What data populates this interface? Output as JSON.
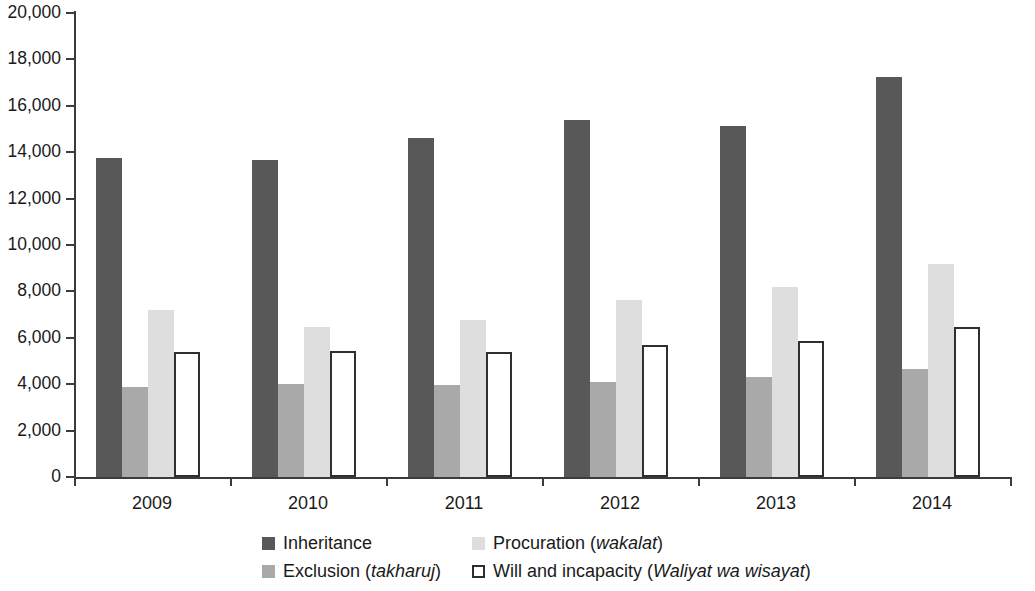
{
  "chart_data": {
    "type": "bar",
    "title": "",
    "subtitle": "",
    "xlabel": "",
    "ylabel": "",
    "categories": [
      "2009",
      "2010",
      "2011",
      "2012",
      "2013",
      "2014"
    ],
    "ylim": [
      0,
      20000
    ],
    "ytick_values": [
      0,
      2000,
      4000,
      6000,
      8000,
      10000,
      12000,
      14000,
      16000,
      18000,
      20000
    ],
    "ytick_labels": [
      "0",
      "2,000",
      "4,000",
      "6,000",
      "8,000",
      "10,000",
      "12,000",
      "14,000",
      "16,000",
      "18,000",
      "20,000"
    ],
    "grid": false,
    "legend_position": "bottom",
    "series": [
      {
        "name": "Inheritance",
        "label_plain": "Inheritance",
        "label_italic": "",
        "color": "#585858",
        "values": [
          13750,
          13650,
          14600,
          15400,
          15150,
          17250
        ]
      },
      {
        "name": "Exclusion (takharuj)",
        "label_plain": "Exclusion (",
        "label_italic": "takharuj",
        "label_tail": ")",
        "color": "#a9a9a9",
        "values": [
          3900,
          4000,
          3950,
          4100,
          4300,
          4650
        ]
      },
      {
        "name": "Procuration (wakalat)",
        "label_plain": "Procuration (",
        "label_italic": "wakalat",
        "label_tail": ")",
        "color": "#dedede",
        "values": [
          7200,
          6450,
          6750,
          7650,
          8200,
          9200
        ]
      },
      {
        "name": "Will and incapacity (Waliyat wa wisayat)",
        "label_plain": "Will and incapacity (",
        "label_italic": "Waliyat wa wisayat",
        "label_tail": ")",
        "color": "#ffffff",
        "border_color": "#2f2f2f",
        "values": [
          5400,
          5450,
          5400,
          5700,
          5850,
          6450
        ]
      }
    ]
  },
  "legend": {
    "items": [
      {
        "series_index": 0,
        "swatch": "dark-gray-swatch"
      },
      {
        "series_index": 2,
        "swatch": "light-gray-swatch"
      },
      {
        "series_index": 1,
        "swatch": "medium-gray-swatch"
      },
      {
        "series_index": 3,
        "swatch": "white-outline-swatch"
      }
    ]
  }
}
